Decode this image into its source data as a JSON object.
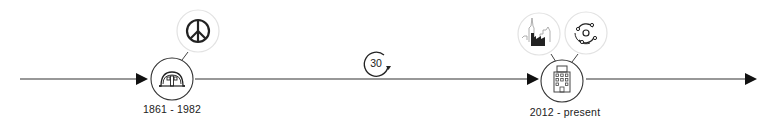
{
  "timeline": {
    "colors": {
      "line": "#222222",
      "node_border": "#333333",
      "halo_border": "#e2e2e2",
      "icon": "#222222"
    },
    "nodes": [
      {
        "id": "node-1",
        "label": "1861 - 1982",
        "icon": "quonset-hut-icon",
        "related": [
          "peace-sign-icon"
        ]
      },
      {
        "id": "interval",
        "label": "30",
        "icon": "cycle-30-icon"
      },
      {
        "id": "node-2",
        "label": "2012 - present",
        "icon": "office-building-icon",
        "related": [
          "factory-skyline-icon",
          "orbit-icon"
        ]
      }
    ]
  }
}
